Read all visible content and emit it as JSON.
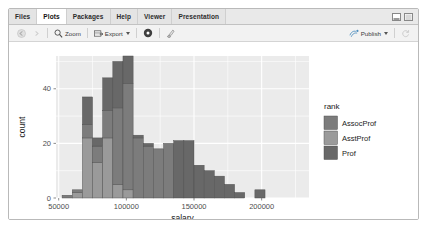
{
  "window": {
    "tabs": [
      {
        "label": "Files",
        "active": false
      },
      {
        "label": "Plots",
        "active": true
      },
      {
        "label": "Packages",
        "active": false
      },
      {
        "label": "Help",
        "active": false
      },
      {
        "label": "Viewer",
        "active": false
      },
      {
        "label": "Presentation",
        "active": false
      }
    ],
    "pane_buttons": [
      "minimize-pane-icon",
      "maximize-pane-icon"
    ]
  },
  "toolbar": {
    "back_icon": "back-arrow-icon",
    "forward_icon": "forward-arrow-icon",
    "zoom_label": "Zoom",
    "zoom_icon": "magnifier-icon",
    "export_label": "Export",
    "export_icon": "export-image-icon",
    "remove_icon": "remove-plot-icon",
    "clear_icon": "clear-all-plots-icon",
    "publish_label": "Publish",
    "publish_icon": "publish-icon",
    "refresh_icon": "refresh-icon"
  },
  "chart_data": {
    "type": "bar",
    "subtype": "stacked-histogram",
    "title": "",
    "xlabel": "salary",
    "ylabel": "count",
    "xlim": [
      48000,
      235000
    ],
    "ylim": [
      0,
      52
    ],
    "xticks": [
      50000,
      100000,
      150000,
      200000
    ],
    "xticklabels": [
      "50000",
      "100000",
      "150000",
      "200000"
    ],
    "yticks": [
      0,
      20,
      40
    ],
    "yticklabels": [
      "0",
      "20",
      "40"
    ],
    "grid": true,
    "panel_bg": "#ebebeb",
    "grid_color": "#ffffff",
    "legend": {
      "title": "rank",
      "position": "right",
      "entries": [
        {
          "label": "AssocProf",
          "color": "#7c7c7c"
        },
        {
          "label": "AsstProf",
          "color": "#9a9a9a"
        },
        {
          "label": "Prof",
          "color": "#686868"
        }
      ]
    },
    "bin_width": 7500,
    "bin_starts": [
      52500,
      60000,
      67500,
      75000,
      82500,
      90000,
      97500,
      105000,
      112500,
      120000,
      127500,
      135000,
      142500,
      150000,
      157500,
      165000,
      172500,
      180000,
      187500,
      195000,
      202500,
      210000,
      217500,
      225000
    ],
    "series": [
      {
        "name": "AsstProf",
        "color": "#9a9a9a",
        "values": [
          0,
          2,
          22,
          13,
          22,
          5,
          3,
          0,
          0,
          0,
          0,
          0,
          0,
          0,
          0,
          0,
          0,
          0,
          0,
          0,
          0,
          0,
          0,
          0
        ]
      },
      {
        "name": "AssocProf",
        "color": "#7c7c7c",
        "values": [
          1,
          1,
          5,
          6,
          10,
          28,
          39,
          22,
          19,
          18,
          20,
          0,
          0,
          0,
          0,
          0,
          0,
          0,
          0,
          0,
          0,
          0,
          0,
          0
        ]
      },
      {
        "name": "Prof",
        "color": "#686868",
        "values": [
          0,
          0,
          10,
          3,
          12,
          17,
          10,
          1,
          1,
          0,
          0,
          21,
          21,
          12,
          10,
          8,
          5,
          2,
          0,
          3,
          0,
          0,
          0,
          0
        ]
      }
    ],
    "totals": [
      1,
      3,
      37,
      22,
      44,
      50,
      52,
      23,
      20,
      18,
      20,
      21,
      21,
      12,
      10,
      8,
      5,
      2,
      0,
      3,
      0,
      0,
      0,
      0
    ]
  }
}
